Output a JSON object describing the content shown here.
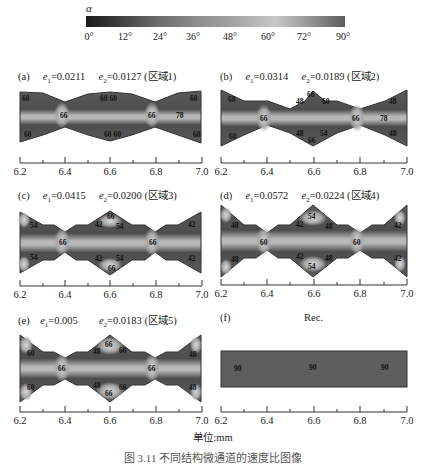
{
  "colorbar": {
    "symbol": "α",
    "ticks": [
      "0°",
      "12°",
      "24°",
      "36°",
      "48°",
      "60°",
      "72°",
      "90°"
    ],
    "gradient_stops": [
      "#1a1a1a",
      "#3c3c3c",
      "#6a6a6a",
      "#8c8c8c",
      "#a3a3a3",
      "#c8c8c8",
      "#8f8f8f",
      "#5c5c5c"
    ]
  },
  "axis": {
    "ticks": [
      "6.2",
      "6.4",
      "6.6",
      "6.8",
      "7.0"
    ],
    "unit_label": "单位:mm"
  },
  "panels": [
    {
      "id": "a",
      "label": "(a)",
      "e1_label": "e",
      "e1_sub": "1",
      "e1_value": "=0.0211",
      "e2_label": "e",
      "e2_sub": "2",
      "e2_value": "=0.0127",
      "region": "(区域1)",
      "contour_labels": [
        "60",
        "60",
        "60",
        "66",
        "60",
        "66",
        "78",
        "60",
        "60",
        "60",
        "60"
      ]
    },
    {
      "id": "b",
      "label": "(b)",
      "e1_label": "e",
      "e1_sub": "1",
      "e1_value": "=0.0314",
      "e2_label": "e",
      "e2_sub": "2",
      "e2_value": "=0.0189",
      "region": "(区域2)",
      "contour_labels": [
        "60",
        "48",
        "66",
        "60",
        "48",
        "66",
        "66",
        "78",
        "60",
        "48",
        "66",
        "54",
        "48"
      ]
    },
    {
      "id": "c",
      "label": "(c)",
      "e1_label": "e",
      "e1_sub": "1",
      "e1_value": "=0.0415",
      "e2_label": "e",
      "e2_sub": "2",
      "e2_value": "=0.0200",
      "region": "(区域3)",
      "contour_labels": [
        "54",
        "42",
        "66",
        "54",
        "42",
        "66",
        "66",
        "54",
        "42",
        "66",
        "54",
        "42"
      ]
    },
    {
      "id": "d",
      "label": "(d)",
      "e1_label": "e",
      "e1_sub": "1",
      "e1_value": "=0.0572",
      "e2_label": "e",
      "e2_sub": "2",
      "e2_value": "=0.0224",
      "region": "(区域4)",
      "contour_labels": [
        "48",
        "42",
        "54",
        "48",
        "42",
        "60",
        "60",
        "48",
        "42",
        "54",
        "48",
        "42"
      ]
    },
    {
      "id": "e",
      "label": "(e)",
      "e1_label": "e",
      "e1_sub": "1",
      "e1_value": "=0.005",
      "e2_label": "e",
      "e2_sub": "2",
      "e2_value": "=0.0183",
      "region": "(区域5)",
      "contour_labels": [
        "60",
        "48",
        "66",
        "60",
        "48",
        "66",
        "66",
        "60",
        "48",
        "66",
        "60",
        "48"
      ]
    },
    {
      "id": "f",
      "label": "(f)",
      "title": "Rec.",
      "contour_labels": [
        "90",
        "90",
        "90"
      ]
    }
  ],
  "caption": "图 3.11 不同结构微通道的速度比图像"
}
